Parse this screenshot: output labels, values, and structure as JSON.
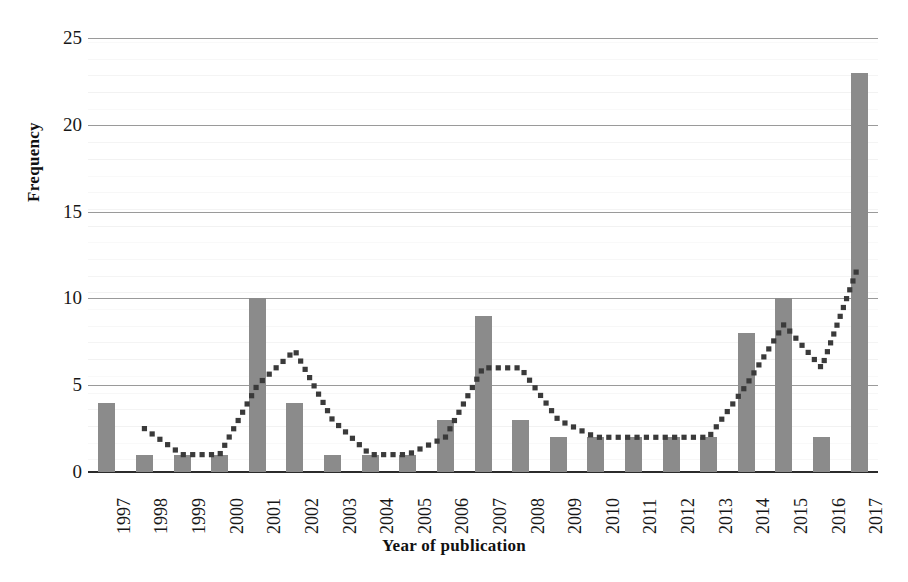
{
  "chart_data": {
    "type": "bar",
    "title": "",
    "xlabel": "Year of publication",
    "ylabel": "Frequency",
    "categories": [
      "1997",
      "1998",
      "1999",
      "2000",
      "2001",
      "2002",
      "2003",
      "2004",
      "2005",
      "2006",
      "2007",
      "2008",
      "2009",
      "2010",
      "2011",
      "2012",
      "2013",
      "2014",
      "2015",
      "2016",
      "2017"
    ],
    "values": [
      4,
      1,
      1,
      1,
      10,
      4,
      1,
      1,
      1,
      3,
      9,
      3,
      2,
      2,
      2,
      2,
      2,
      8,
      10,
      2,
      23
    ],
    "series": [
      {
        "name": "Frequency",
        "kind": "bar",
        "values": [
          4,
          1,
          1,
          1,
          10,
          4,
          1,
          1,
          1,
          3,
          9,
          3,
          2,
          2,
          2,
          2,
          2,
          8,
          10,
          2,
          23
        ]
      },
      {
        "name": "Moving average trendline",
        "kind": "line",
        "style": "dotted",
        "values": [
          null,
          2.5,
          1.0,
          1.0,
          5.0,
          7.0,
          3.0,
          1.0,
          1.0,
          2.0,
          6.0,
          6.0,
          3.0,
          2.0,
          2.0,
          2.0,
          2.0,
          5.0,
          8.5,
          6.0,
          12.0
        ]
      }
    ],
    "ylim": [
      0,
      25
    ],
    "yticks": [
      0,
      5,
      10,
      15,
      20,
      25
    ],
    "ytick_labels": [
      "0",
      "5",
      "10",
      "15",
      "20",
      "25"
    ],
    "grid": true,
    "grid_axis": "y",
    "legend": false,
    "legend_position": "none",
    "bar_color": "#8b8b8b",
    "line_color": "#3a3a3a",
    "gridline_color": "#9a9a9a",
    "axis_color": "#2b2b2b",
    "background_color": "#ffffff",
    "annotations": []
  },
  "axes": {
    "y_title": "Frequency",
    "x_title": "Year of publication"
  }
}
